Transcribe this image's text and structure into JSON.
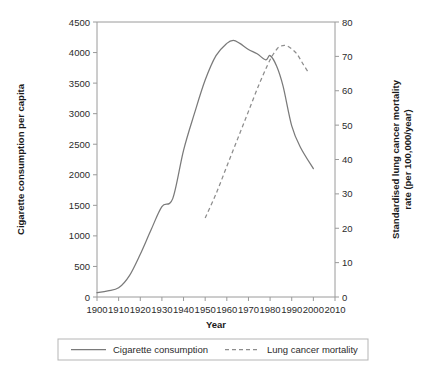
{
  "chart_data": {
    "type": "line",
    "title": "",
    "xlabel": "Year",
    "ylabel": "Cigarette consumption per capita",
    "y2label": "Standardised lung cancer mortality rate (per 100,000/year)",
    "xlim": [
      1900,
      2010
    ],
    "ylim": [
      0,
      4500
    ],
    "y2lim": [
      0,
      80
    ],
    "grid": false,
    "legend_position": "bottom",
    "xticks": [
      1900,
      1910,
      1920,
      1930,
      1940,
      1950,
      1960,
      1970,
      1980,
      1990,
      2000,
      2010
    ],
    "yticks": [
      0,
      500,
      1000,
      1500,
      2000,
      2500,
      3000,
      3500,
      4000,
      4500
    ],
    "y2ticks": [
      0,
      10,
      20,
      30,
      40,
      50,
      60,
      70,
      80
    ],
    "series": [
      {
        "name": "Cigarette consumption",
        "axis": "left",
        "style": "solid",
        "color": "#7a7a7a",
        "x": [
          1900,
          1905,
          1910,
          1915,
          1920,
          1925,
          1930,
          1935,
          1940,
          1945,
          1950,
          1955,
          1960,
          1963,
          1966,
          1970,
          1974,
          1978,
          1980,
          1983,
          1986,
          1990,
          1994,
          2000
        ],
        "values": [
          70,
          100,
          150,
          350,
          700,
          1100,
          1480,
          1610,
          2400,
          3000,
          3550,
          3950,
          4150,
          4200,
          4150,
          4050,
          3980,
          3880,
          3950,
          3780,
          3450,
          2800,
          2450,
          2100
        ]
      },
      {
        "name": "Lung cancer mortality",
        "axis": "right",
        "style": "dashed",
        "color": "#8d8d8d",
        "x": [
          1950,
          1955,
          1960,
          1965,
          1970,
          1975,
          1980,
          1983,
          1985,
          1988,
          1992,
          1995,
          1998
        ],
        "values": [
          23,
          30,
          38,
          46,
          54,
          62,
          69,
          72,
          73,
          73,
          71,
          68,
          65
        ]
      }
    ]
  },
  "legend": {
    "entries": [
      {
        "label": "Cigarette consumption",
        "style": "solid"
      },
      {
        "label": "Lung cancer mortality",
        "style": "dashed"
      }
    ]
  },
  "axes": {
    "x_title": "Year",
    "y_left_title": "Cigarette consumption per capita",
    "y_right_title_line1": "Standardised lung cancer mortality",
    "y_right_title_line2": "rate (per 100,000/year)"
  }
}
